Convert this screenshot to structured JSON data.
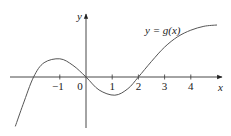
{
  "chart_data": {
    "type": "line",
    "title": "",
    "curve_label": "y = g(x)",
    "xlabel": "x",
    "ylabel": "y",
    "x_ticks": [
      -1,
      0,
      1,
      2,
      3,
      4
    ],
    "x_tick_labels": [
      "−1",
      "0",
      "1",
      "2",
      "3",
      "4"
    ],
    "xlim": [
      -3.2,
      5.2
    ],
    "ylim": [
      -1.9,
      2.4
    ],
    "grid": false,
    "legend": "none",
    "series": [
      {
        "name": "g(x)",
        "x": [
          -2.7,
          -2.4,
          -2.0,
          -1.6,
          -1.0,
          -0.5,
          0.0,
          0.5,
          1.1,
          1.6,
          2.0,
          2.5,
          3.0,
          3.5,
          4.0,
          4.5,
          5.0
        ],
        "y": [
          -1.9,
          -1.05,
          0.0,
          0.55,
          0.7,
          0.45,
          0.0,
          -0.5,
          -0.7,
          -0.45,
          0.0,
          0.6,
          1.15,
          1.55,
          1.8,
          1.95,
          2.0
        ]
      }
    ],
    "annotations": {
      "zeros": [
        -2,
        0,
        2
      ],
      "local_max": {
        "x": -1,
        "y": 0.7
      },
      "local_min": {
        "x": 1.1,
        "y": -0.7
      }
    }
  },
  "labels": {
    "curve": "y = g(x)",
    "x_axis": "x",
    "y_axis": "y",
    "ticks": [
      "−1",
      "0",
      "1",
      "2",
      "3",
      "4"
    ]
  }
}
